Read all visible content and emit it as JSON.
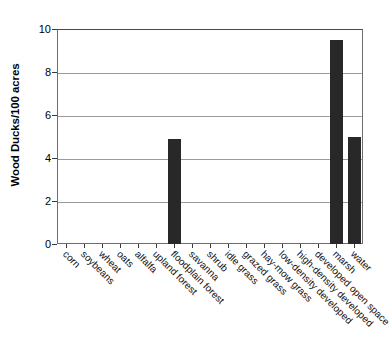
{
  "chart_data": {
    "type": "bar",
    "title": "",
    "subtitle": "",
    "xlabel": "",
    "ylabel": "Wood Ducks/100 acres",
    "ylim": [
      0,
      10
    ],
    "yticks": [
      0,
      2,
      4,
      6,
      8,
      10
    ],
    "grid": true,
    "legend": "none",
    "bar_color": "#282828",
    "categories": [
      "corn",
      "soybeans",
      "wheat",
      "oats",
      "alfalfa",
      "upland forest",
      "floodplain forest",
      "savanna",
      "shrub",
      "idle grass",
      "grazed grass",
      "hay-mow grass",
      "low-density developed",
      "high-density developed",
      "developed open space",
      "marsh",
      "water"
    ],
    "values": [
      0,
      0,
      0,
      0,
      0,
      0,
      4.9,
      0,
      0,
      0,
      0,
      0,
      0,
      0,
      0,
      9.5,
      5.0
    ]
  },
  "figure": {
    "background_color": "#ffffff",
    "frame_color": "#6e6e6e",
    "gridline_color": "#9b9b9b"
  }
}
